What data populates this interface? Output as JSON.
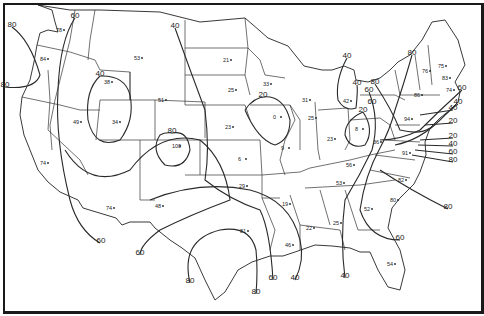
{
  "map": {
    "subject": "United States contour map",
    "isolines": [
      {
        "value": "60",
        "x": 75,
        "y": 18
      },
      {
        "value": "80",
        "x": 12,
        "y": 27
      },
      {
        "value": "80",
        "x": 5,
        "y": 87
      },
      {
        "value": "40",
        "x": 100,
        "y": 76
      },
      {
        "value": "40",
        "x": 175,
        "y": 28
      },
      {
        "value": "80",
        "x": 172,
        "y": 133
      },
      {
        "value": "20",
        "x": 263,
        "y": 97
      },
      {
        "value": "40",
        "x": 347,
        "y": 58
      },
      {
        "value": "40",
        "x": 357,
        "y": 85
      },
      {
        "value": "20",
        "x": 363,
        "y": 112
      },
      {
        "value": "60",
        "x": 369,
        "y": 92
      },
      {
        "value": "60",
        "x": 372,
        "y": 104
      },
      {
        "value": "80",
        "x": 375,
        "y": 84
      },
      {
        "value": "80",
        "x": 412,
        "y": 55
      },
      {
        "value": "60",
        "x": 462,
        "y": 90
      },
      {
        "value": "40",
        "x": 458,
        "y": 104
      },
      {
        "value": "40",
        "x": 453,
        "y": 110
      },
      {
        "value": "20",
        "x": 453,
        "y": 123
      },
      {
        "value": "20",
        "x": 453,
        "y": 138
      },
      {
        "value": "40",
        "x": 453,
        "y": 146
      },
      {
        "value": "60",
        "x": 453,
        "y": 154
      },
      {
        "value": "80",
        "x": 453,
        "y": 162
      },
      {
        "value": "80",
        "x": 448,
        "y": 209
      },
      {
        "value": "60",
        "x": 400,
        "y": 240
      },
      {
        "value": "60",
        "x": 101,
        "y": 243
      },
      {
        "value": "60",
        "x": 140,
        "y": 255
      },
      {
        "value": "80",
        "x": 190,
        "y": 283
      },
      {
        "value": "60",
        "x": 273,
        "y": 280
      },
      {
        "value": "40",
        "x": 295,
        "y": 280
      },
      {
        "value": "80",
        "x": 256,
        "y": 294
      },
      {
        "value": "40",
        "x": 345,
        "y": 278
      }
    ],
    "points": [
      {
        "value": "78",
        "x": 56,
        "y": 32
      },
      {
        "value": "84",
        "x": 40,
        "y": 61
      },
      {
        "value": "53",
        "x": 134,
        "y": 60
      },
      {
        "value": "38",
        "x": 104,
        "y": 84
      },
      {
        "value": "51",
        "x": 158,
        "y": 102
      },
      {
        "value": "34",
        "x": 112,
        "y": 124
      },
      {
        "value": "49",
        "x": 73,
        "y": 124
      },
      {
        "value": "74",
        "x": 40,
        "y": 165
      },
      {
        "value": "100",
        "x": 172,
        "y": 148
      },
      {
        "value": "21",
        "x": 223,
        "y": 62
      },
      {
        "value": "25",
        "x": 228,
        "y": 92
      },
      {
        "value": "33",
        "x": 263,
        "y": 86
      },
      {
        "value": "23",
        "x": 225,
        "y": 129
      },
      {
        "value": "0",
        "x": 273,
        "y": 119
      },
      {
        "value": "31",
        "x": 302,
        "y": 102
      },
      {
        "value": "25",
        "x": 308,
        "y": 120
      },
      {
        "value": "42",
        "x": 343,
        "y": 103
      },
      {
        "value": "8",
        "x": 355,
        "y": 131
      },
      {
        "value": "9",
        "x": 281,
        "y": 150
      },
      {
        "value": "6",
        "x": 238,
        "y": 161
      },
      {
        "value": "23",
        "x": 327,
        "y": 141
      },
      {
        "value": "36",
        "x": 373,
        "y": 144
      },
      {
        "value": "29",
        "x": 239,
        "y": 188
      },
      {
        "value": "74",
        "x": 106,
        "y": 210
      },
      {
        "value": "48",
        "x": 155,
        "y": 208
      },
      {
        "value": "19",
        "x": 282,
        "y": 206
      },
      {
        "value": "56",
        "x": 346,
        "y": 167
      },
      {
        "value": "53",
        "x": 336,
        "y": 185
      },
      {
        "value": "81",
        "x": 240,
        "y": 233
      },
      {
        "value": "46",
        "x": 285,
        "y": 247
      },
      {
        "value": "22",
        "x": 306,
        "y": 230
      },
      {
        "value": "25",
        "x": 333,
        "y": 225
      },
      {
        "value": "52",
        "x": 364,
        "y": 211
      },
      {
        "value": "91",
        "x": 402,
        "y": 155
      },
      {
        "value": "82",
        "x": 398,
        "y": 182
      },
      {
        "value": "80",
        "x": 390,
        "y": 202
      },
      {
        "value": "94",
        "x": 404,
        "y": 121
      },
      {
        "value": "86",
        "x": 414,
        "y": 97
      },
      {
        "value": "76",
        "x": 422,
        "y": 73
      },
      {
        "value": "74",
        "x": 446,
        "y": 92
      },
      {
        "value": "75",
        "x": 438,
        "y": 68
      },
      {
        "value": "83",
        "x": 442,
        "y": 80
      },
      {
        "value": "54",
        "x": 387,
        "y": 266
      }
    ]
  }
}
